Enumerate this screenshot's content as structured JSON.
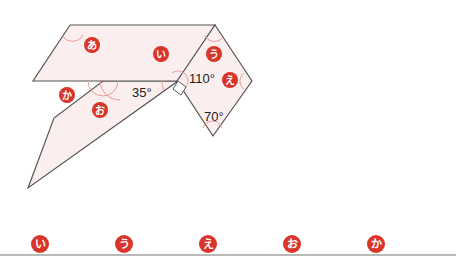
{
  "diagram": {
    "colors": {
      "fill": "#fbeeee",
      "stroke": "#555555",
      "arc": "#e79a9a",
      "badge": "#d9352b",
      "badge_text": "#ffffff",
      "baseline": "#777777"
    },
    "angles": {
      "a35": "35°",
      "a110": "110°",
      "a70": "70°"
    },
    "figure_labels": {
      "a": "あ",
      "i": "い",
      "u": "う",
      "e": "え",
      "o": "お",
      "ka": "か"
    },
    "answer_labels": [
      "い",
      "う",
      "え",
      "お",
      "か"
    ]
  }
}
